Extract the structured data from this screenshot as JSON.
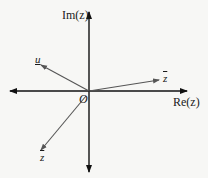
{
  "diagram": {
    "type": "complex-plane-vectors",
    "colors": {
      "background": "#f7f7f5",
      "axis": "#111111",
      "vector": "#555555",
      "text": "#1a1a1a"
    },
    "axes": {
      "x_label": "Re(z)",
      "y_label": "Im(z)",
      "origin_label": "O"
    },
    "vectors": [
      {
        "id": "u",
        "label": "u",
        "decoration": "underline",
        "direction": "upper-left"
      },
      {
        "id": "z",
        "label": "z",
        "decoration": "overline",
        "direction": "right, slightly up"
      },
      {
        "id": "z-lower",
        "label": "z",
        "decoration": "overline",
        "direction": "lower-left"
      }
    ]
  }
}
